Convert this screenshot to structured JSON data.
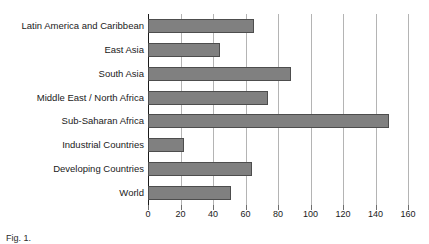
{
  "chart_data": {
    "type": "bar",
    "orientation": "horizontal",
    "title": "",
    "xlabel": "",
    "ylabel": "",
    "xlim": [
      0,
      160
    ],
    "xticks": [
      0,
      20,
      40,
      60,
      80,
      100,
      120,
      140,
      160
    ],
    "tick_labels": [
      "0",
      "20",
      "40",
      "60",
      "80",
      "100",
      "120",
      "140",
      "160"
    ],
    "grid": "vertical",
    "legend": "none",
    "bar_color": "#808080",
    "bar_edge_color": "#4d4d4d",
    "gridline_color": "#b4b4b4",
    "axis_color": "#1a1a1a",
    "categories": [
      "Latin America and Caribbean",
      "East Asia",
      "South Asia",
      "Middle East / North Africa",
      "Sub-Saharan Africa",
      "Industrial Countries",
      "Developing Countries",
      "World"
    ],
    "values": [
      65,
      44,
      88,
      74,
      148,
      22,
      64,
      51
    ]
  },
  "caption": {
    "text": "Fig. 1."
  }
}
